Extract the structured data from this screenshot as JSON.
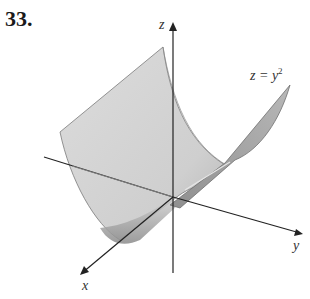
{
  "problem": {
    "number": "33."
  },
  "axes": {
    "x_label": "x",
    "y_label": "y",
    "z_label": "z"
  },
  "surface": {
    "equation_lhs": "z = y",
    "equation_exp": "2",
    "description": "parabolic cylinder z = y^2 extended along the x-axis"
  },
  "colors": {
    "surface_light": "#d9d9d9",
    "surface_mid": "#c2c2c2",
    "surface_dark": "#9a9a9a",
    "surface_edge": "#7a7a7a",
    "axis": "#222222"
  }
}
